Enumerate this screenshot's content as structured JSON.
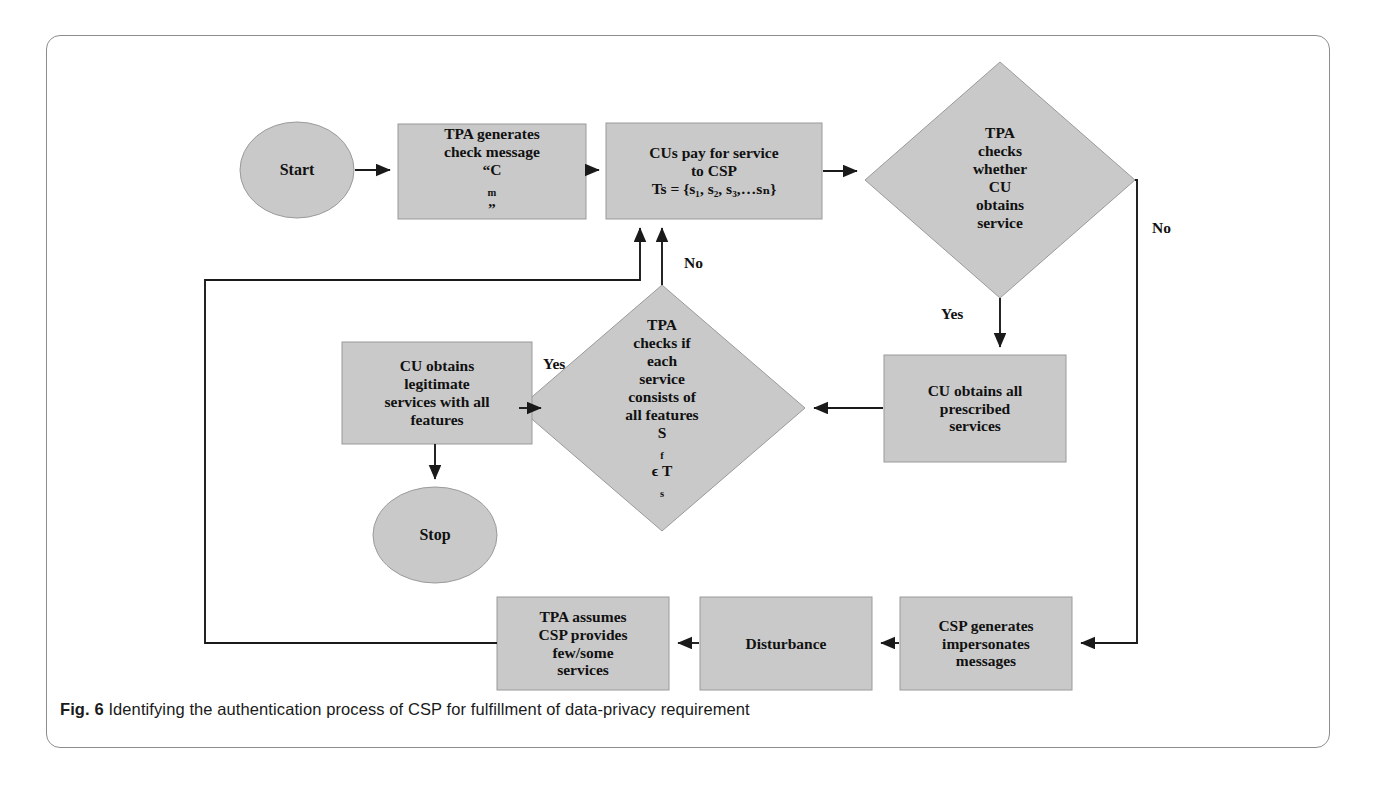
{
  "figure": {
    "caption_number": "Fig. 6",
    "caption_text": "Identifying the authentication process of CSP for fulfillment of data-privacy requirement"
  },
  "colors": {
    "shape_fill": "#c9c9c9",
    "shape_stroke": "#9a9a9a",
    "edge_stroke": "#1a1a1a",
    "frame_stroke": "#8d8d8d",
    "text": "#111111"
  },
  "nodes": {
    "start": {
      "label": "Start",
      "shape": "ellipse"
    },
    "tpa_generates": {
      "shape": "process",
      "line1": "TPA generates",
      "line2": "check message",
      "line3_pre": "“C",
      "line3_sub": "m",
      "line3_post": "”"
    },
    "cus_pay": {
      "shape": "process",
      "line1": "CUs pay for service",
      "line2": "to CSP",
      "line3": "Ts = {s₁, s₂, s₃,…sₙ}"
    },
    "decision_service": {
      "shape": "decision",
      "line1": "TPA",
      "line2": "checks",
      "line3": "whether",
      "line4": "CU",
      "line5": "obtains",
      "line6": "service"
    },
    "cu_prescribed": {
      "shape": "process",
      "line1": "CU obtains all",
      "line2": "prescribed",
      "line3": "services"
    },
    "decision_features": {
      "shape": "decision",
      "line1": "TPA",
      "line2": "checks if",
      "line3": "each",
      "line4": "service",
      "line5": "consists of",
      "line6": "all features",
      "line7_pre": "S",
      "line7_sub1": "f",
      "line7_mid": " ϵ T",
      "line7_sub2": "s"
    },
    "cu_legitimate": {
      "shape": "process",
      "line1": "CU obtains",
      "line2": "legitimate",
      "line3": "services with all",
      "line4": "features"
    },
    "stop": {
      "label": "Stop",
      "shape": "ellipse"
    },
    "tpa_assumes": {
      "shape": "process",
      "line1": "TPA assumes",
      "line2": "CSP provides",
      "line3": "few/some",
      "line4": "services"
    },
    "disturbance": {
      "shape": "process",
      "line1": "Disturbance"
    },
    "csp_generates": {
      "shape": "process",
      "line1": "CSP generates",
      "line2": "impersonates",
      "line3": "messages"
    }
  },
  "edge_labels": {
    "no_right": "No",
    "yes_down": "Yes",
    "no_center": "No",
    "yes_left": "Yes"
  }
}
